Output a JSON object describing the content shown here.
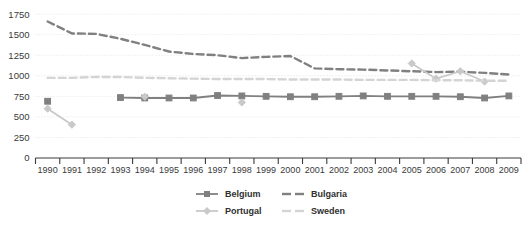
{
  "chart_data": {
    "type": "line",
    "title": "",
    "xlabel": "",
    "ylabel": "",
    "grid": true,
    "legend_position": "bottom",
    "ylim": [
      0,
      1800
    ],
    "yticks": [
      0,
      250,
      500,
      750,
      1000,
      1250,
      1500,
      1750
    ],
    "ytick_labels": [
      "0",
      "250",
      "500",
      "750",
      "1000",
      "1250",
      "1500",
      "1750"
    ],
    "categories": [
      "1990",
      "1991",
      "1992",
      "1993",
      "1994",
      "1995",
      "1996",
      "1997",
      "1998",
      "1999",
      "2000",
      "2001",
      "2002",
      "2003",
      "2004",
      "2005",
      "2006",
      "2007",
      "2008",
      "2009"
    ],
    "series": [
      {
        "name": "Belgium",
        "color": "#808080",
        "style": "solid",
        "marker": "square",
        "values": [
          690,
          null,
          null,
          735,
          730,
          730,
          730,
          760,
          755,
          750,
          745,
          745,
          750,
          755,
          750,
          750,
          750,
          745,
          730,
          755
        ]
      },
      {
        "name": "Bulgaria",
        "color": "#808080",
        "style": "dashed",
        "marker": "none",
        "values": [
          1660,
          1515,
          1510,
          1450,
          1375,
          1295,
          1265,
          1250,
          1215,
          1230,
          1240,
          1090,
          1080,
          1075,
          1065,
          1055,
          1045,
          1050,
          1035,
          1015
        ]
      },
      {
        "name": "Portugal",
        "color": "#c9c9c9",
        "style": "solid",
        "marker": "diamond",
        "values": [
          600,
          405,
          null,
          null,
          745,
          null,
          null,
          null,
          675,
          null,
          null,
          null,
          null,
          null,
          null,
          1150,
          965,
          1055,
          930,
          null
        ]
      },
      {
        "name": "Sweden",
        "color": "#d4d4d4",
        "style": "dashed",
        "marker": "none",
        "values": [
          975,
          975,
          985,
          985,
          975,
          970,
          965,
          960,
          960,
          960,
          955,
          955,
          955,
          950,
          950,
          950,
          945,
          945,
          940,
          940
        ]
      }
    ]
  },
  "legend": {
    "items": [
      {
        "label": "Belgium"
      },
      {
        "label": "Bulgaria"
      },
      {
        "label": "Portugal"
      },
      {
        "label": "Sweden"
      }
    ]
  }
}
